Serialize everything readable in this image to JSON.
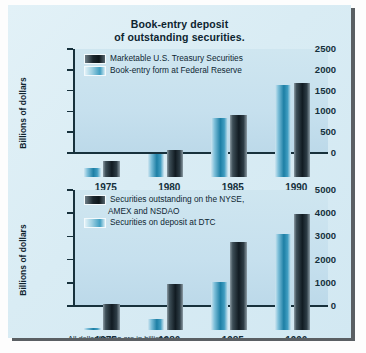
{
  "card": {
    "title_line1": "Book-entry deposit",
    "title_line2": "of outstanding securities.",
    "footnote": "All dollar figures are in billions.",
    "bg_color": "#d9ecf4",
    "accent_blue": "#1d7fa5",
    "accent_dark": "#111b22"
  },
  "chart_data": [
    {
      "type": "bar",
      "title": "Book-entry deposit of outstanding securities.",
      "xlabel": "",
      "ylabel": "Billions of dollars",
      "categories": [
        "1975",
        "1980",
        "1985",
        "1990"
      ],
      "ylim": [
        0,
        2500
      ],
      "yticks": [
        "0",
        "500",
        "1000",
        "1500",
        "2000",
        "2500"
      ],
      "grid": false,
      "legend_position": "top-left",
      "series": [
        {
          "name": "Book-entry form at Federal Reserve",
          "color": "#1d7fa5",
          "values": [
            225,
            555,
            1430,
            2200
          ]
        },
        {
          "name": "Marketable U.S. Treasury Securities",
          "color": "#111b22",
          "values": [
            380,
            650,
            1480,
            2270
          ]
        }
      ],
      "legend_order": [
        "Marketable U.S. Treasury Securities",
        "Book-entry form at Federal Reserve"
      ]
    },
    {
      "type": "bar",
      "title": "",
      "xlabel": "",
      "ylabel": "Billions of dollars",
      "categories": [
        "1975",
        "1980",
        "1985",
        "1990"
      ],
      "ylim": [
        0,
        5000
      ],
      "yticks": [
        "0",
        "1000",
        "2000",
        "3000",
        "4000",
        "5000"
      ],
      "grid": false,
      "legend_position": "top-left",
      "series": [
        {
          "name": "Securities on deposit at DTC",
          "color": "#1d7fa5",
          "values": [
            100,
            480,
            2050,
            4150
          ]
        },
        {
          "name": "Securities outstanding on the NYSE, AMEX and NSDAO",
          "color": "#111b22",
          "values": [
            1120,
            2000,
            3780,
            5020
          ]
        }
      ],
      "legend_order": [
        "Securities outstanding on the NYSE, AMEX and NSDAO",
        "Securities on deposit at DTC"
      ]
    }
  ],
  "legend_top": {
    "item1": "Marketable U.S. Treasury Securities",
    "item2": "Book-entry form at Federal Reserve"
  },
  "legend_bottom": {
    "item1_line1": "Securities outstanding on the NYSE,",
    "item1_line2": "AMEX and NSDAO",
    "item2": "Securities on deposit at DTC"
  }
}
